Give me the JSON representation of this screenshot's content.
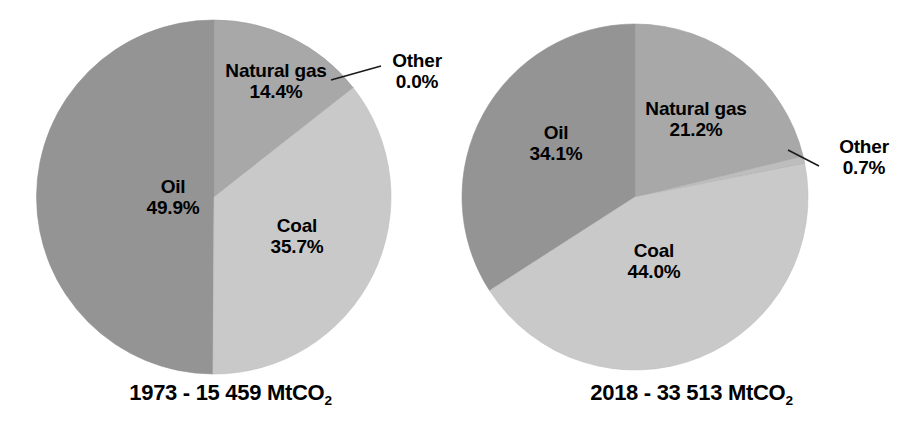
{
  "figure": {
    "background_color": "#ffffff",
    "text_color": "#000000"
  },
  "palette": {
    "oil": "#949494",
    "natural_gas": "#a8a8a8",
    "coal": "#c9c9c9",
    "other": "#bdbdbd",
    "slice_outline": "#8a8a8a",
    "leader_line": "#1a1a1a"
  },
  "panels": [
    {
      "id": "1973",
      "caption_prefix": "1973 - 15 459 MtCO",
      "caption_sub": "2",
      "labels": {
        "oil_name": "Oil",
        "oil_pct": "49.9%",
        "gas_name": "Natural gas",
        "gas_pct": "14.4%",
        "coal_name": "Coal",
        "coal_pct": "35.7%",
        "other_name": "Other",
        "other_pct": "0.0%"
      }
    },
    {
      "id": "2018",
      "caption_prefix": "2018 - 33 513 MtCO",
      "caption_sub": "2",
      "labels": {
        "oil_name": "Oil",
        "oil_pct": "34.1%",
        "gas_name": "Natural gas",
        "gas_pct": "21.2%",
        "coal_name": "Coal",
        "coal_pct": "44.0%",
        "other_name": "Other",
        "other_pct": "0.7%"
      }
    }
  ],
  "chart_data": [
    {
      "type": "pie",
      "title": "1973 - 15 459 MtCO2",
      "total_value": 15459,
      "total_unit": "MtCO2",
      "year": 1973,
      "start_angle_deg": 0,
      "direction": "clockwise",
      "categories": [
        "Natural gas",
        "Other",
        "Coal",
        "Oil"
      ],
      "values": [
        14.4,
        0.0,
        35.7,
        49.9
      ],
      "value_unit": "percent",
      "labels": [
        "14.4%",
        "0.0%",
        "35.7%",
        "49.9%"
      ],
      "colors": [
        "#a8a8a8",
        "#bdbdbd",
        "#c9c9c9",
        "#949494"
      ],
      "legend": "none",
      "annotations": [
        "Other 0.0% uses a leader line to a near-zero sliver at the 3 o'clock edge"
      ]
    },
    {
      "type": "pie",
      "title": "2018 - 33 513 MtCO2",
      "total_value": 33513,
      "total_unit": "MtCO2",
      "year": 2018,
      "start_angle_deg": 0,
      "direction": "clockwise",
      "categories": [
        "Natural gas",
        "Other",
        "Coal",
        "Oil"
      ],
      "values": [
        21.2,
        0.7,
        44.0,
        34.1
      ],
      "value_unit": "percent",
      "labels": [
        "21.2%",
        "0.7%",
        "44.0%",
        "34.1%"
      ],
      "colors": [
        "#a8a8a8",
        "#bdbdbd",
        "#c9c9c9",
        "#949494"
      ],
      "legend": "none",
      "annotations": [
        "Other 0.7% uses a leader line to a thin sliver just past the 3 o'clock edge"
      ]
    }
  ]
}
